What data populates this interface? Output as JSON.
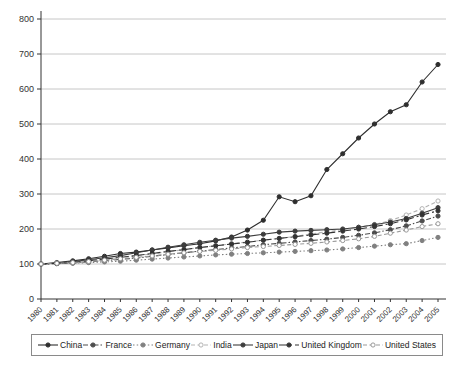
{
  "chart_data": {
    "type": "line",
    "title": "",
    "xlabel": "",
    "ylabel": "",
    "ylim": [
      0,
      800
    ],
    "yticks": [
      0,
      100,
      200,
      300,
      400,
      500,
      600,
      700,
      800
    ],
    "grid": true,
    "legend_position": "bottom",
    "categories": [
      "1980",
      "1981",
      "1982",
      "1983",
      "1984",
      "1985",
      "1986",
      "1987",
      "1988",
      "1989",
      "1990",
      "1991",
      "1992",
      "1993",
      "1994",
      "1995",
      "1996",
      "1997",
      "1998",
      "1999",
      "2000",
      "2001",
      "2002",
      "2003",
      "2004",
      "2005"
    ],
    "series": [
      {
        "name": "China",
        "color": "#2e2e2e",
        "line": "solid",
        "marker": "filled",
        "values": [
          100,
          104,
          109,
          115,
          122,
          130,
          134,
          140,
          146,
          152,
          158,
          166,
          177,
          197,
          225,
          292,
          278,
          295,
          370,
          415,
          460,
          500,
          535,
          555,
          620,
          670
        ]
      },
      {
        "name": "France",
        "color": "#4d4d4d",
        "line": "dashdot",
        "marker": "filled",
        "values": [
          100,
          101,
          103,
          106,
          110,
          113,
          117,
          122,
          127,
          132,
          137,
          141,
          146,
          150,
          155,
          159,
          163,
          167,
          171,
          176,
          182,
          189,
          198,
          209,
          223,
          237
        ]
      },
      {
        "name": "Germany",
        "color": "#808080",
        "line": "dotted",
        "marker": "filled",
        "values": [
          100,
          101,
          102,
          104,
          106,
          108,
          111,
          114,
          117,
          120,
          123,
          126,
          128,
          130,
          132,
          134,
          136,
          138,
          140,
          143,
          147,
          151,
          155,
          158,
          167,
          176
        ]
      },
      {
        "name": "India",
        "color": "#b3b3b3",
        "line": "dashed",
        "marker": "open",
        "values": [
          100,
          103,
          106,
          110,
          114,
          119,
          124,
          129,
          135,
          141,
          147,
          152,
          158,
          163,
          168,
          173,
          179,
          186,
          192,
          198,
          205,
          213,
          224,
          240,
          258,
          280
        ]
      },
      {
        "name": "Japan",
        "color": "#3d3d3d",
        "line": "solid",
        "marker": "filled",
        "values": [
          100,
          103,
          107,
          112,
          118,
          124,
          132,
          140,
          148,
          155,
          162,
          168,
          174,
          179,
          185,
          191,
          194,
          196,
          198,
          200,
          205,
          212,
          220,
          230,
          245,
          261
        ]
      },
      {
        "name": "United Kingdom",
        "color": "#333333",
        "line": "dashdotlong",
        "marker": "filled",
        "values": [
          100,
          102,
          105,
          109,
          114,
          119,
          124,
          130,
          136,
          141,
          147,
          152,
          157,
          162,
          168,
          173,
          178,
          183,
          188,
          194,
          200,
          207,
          215,
          226,
          240,
          252
        ]
      },
      {
        "name": "United States",
        "color": "#999999",
        "line": "dashed",
        "marker": "open",
        "values": [
          100,
          102,
          104,
          107,
          111,
          115,
          119,
          123,
          128,
          132,
          136,
          139,
          143,
          147,
          150,
          153,
          156,
          159,
          163,
          167,
          172,
          179,
          188,
          197,
          207,
          215
        ]
      }
    ],
    "axis_color": "#333333",
    "gridline_color": "#b8b8b8"
  }
}
